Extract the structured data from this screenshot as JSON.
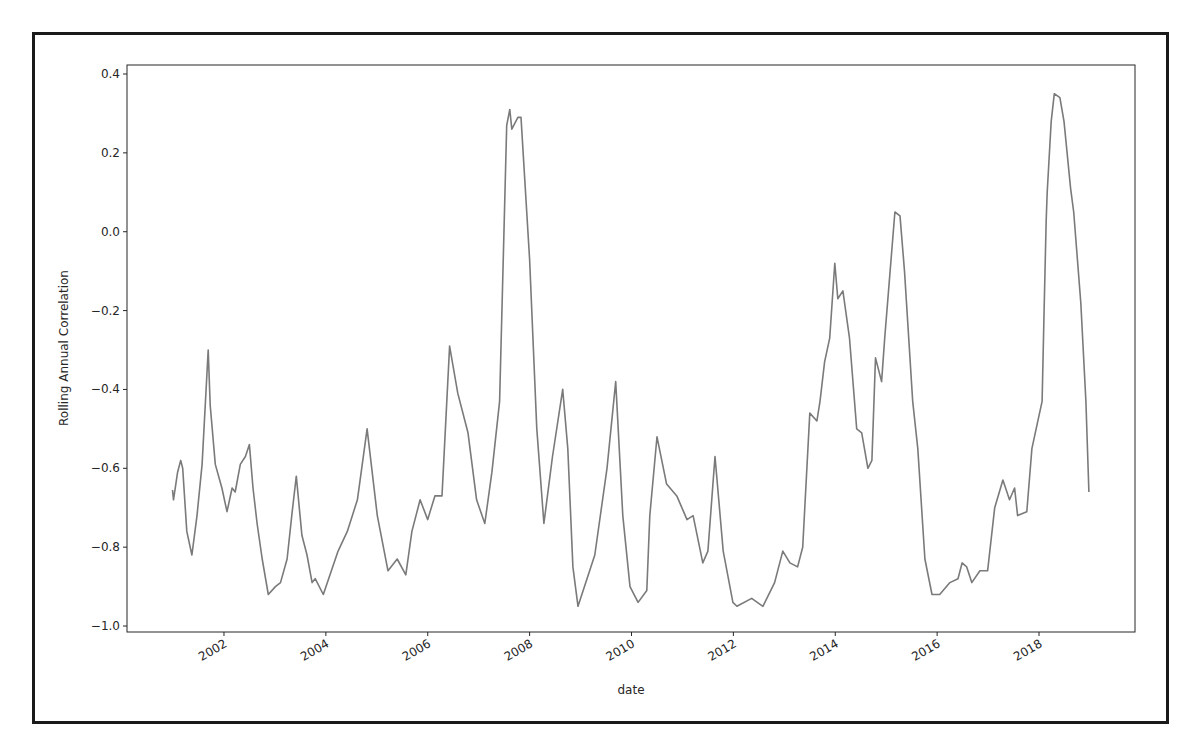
{
  "figure": {
    "border_color": "#1a1a1a",
    "line_color": "#7a7a7a",
    "axes_color": "#262626"
  },
  "chart_data": {
    "type": "line",
    "title": "",
    "xlabel": "date",
    "ylabel": "Rolling Annual Correlation",
    "xlim": [
      2000.1,
      2019.85
    ],
    "ylim": [
      -1.02,
      0.43
    ],
    "grid": false,
    "legend": null,
    "x_ticks": [
      2002,
      2004,
      2006,
      2008,
      2010,
      2012,
      2014,
      2016,
      2018
    ],
    "x_tick_labels": [
      "2002",
      "2004",
      "2006",
      "2008",
      "2010",
      "2012",
      "2014",
      "2016",
      "2018"
    ],
    "x_tick_rotation": -30,
    "y_ticks": [
      0.4,
      0.2,
      0.0,
      -0.2,
      -0.4,
      -0.6,
      -0.8,
      -1.0
    ],
    "y_tick_labels": [
      "0.4",
      "0.2",
      "0.0",
      "−0.2",
      "−0.4",
      "−0.6",
      "−0.8",
      "−1.0"
    ],
    "series": [
      {
        "name": "Rolling Annual Correlation",
        "x": [
          2000.99,
          2001.01,
          2001.09,
          2001.15,
          2001.19,
          2001.27,
          2001.37,
          2001.47,
          2001.57,
          2001.69,
          2001.73,
          2001.83,
          2001.96,
          2002.06,
          2002.16,
          2002.22,
          2002.32,
          2002.42,
          2002.5,
          2002.57,
          2002.65,
          2002.75,
          2002.87,
          2003.01,
          2003.11,
          2003.24,
          2003.34,
          2003.42,
          2003.53,
          2003.63,
          2003.73,
          2003.79,
          2003.95,
          2004.24,
          2004.42,
          2004.62,
          2004.81,
          2005.01,
          2005.22,
          2005.4,
          2005.57,
          2005.69,
          2005.85,
          2006.0,
          2006.14,
          2006.28,
          2006.43,
          2006.59,
          2006.79,
          2006.96,
          2007.12,
          2007.26,
          2007.41,
          2007.55,
          2007.61,
          2007.65,
          2007.77,
          2007.83,
          2008.0,
          2008.14,
          2008.28,
          2008.45,
          2008.65,
          2008.75,
          2008.85,
          2008.95,
          2009.28,
          2009.52,
          2009.69,
          2009.83,
          2009.97,
          2010.13,
          2010.3,
          2010.36,
          2010.5,
          2010.69,
          2010.89,
          2011.09,
          2011.21,
          2011.4,
          2011.5,
          2011.64,
          2011.8,
          2011.99,
          2012.07,
          2012.36,
          2012.58,
          2012.81,
          2012.97,
          2013.11,
          2013.26,
          2013.36,
          2013.5,
          2013.64,
          2013.7,
          2013.79,
          2013.89,
          2013.99,
          2014.05,
          2014.15,
          2014.28,
          2014.42,
          2014.52,
          2014.64,
          2014.72,
          2014.79,
          2014.91,
          2014.97,
          2015.07,
          2015.17,
          2015.27,
          2015.36,
          2015.52,
          2015.62,
          2015.76,
          2015.9,
          2016.05,
          2016.25,
          2016.41,
          2016.49,
          2016.58,
          2016.68,
          2016.84,
          2016.99,
          2017.13,
          2017.29,
          2017.42,
          2017.52,
          2017.58,
          2017.76,
          2017.86,
          2017.96,
          2018.06,
          2018.1,
          2018.14,
          2018.16,
          2018.24,
          2018.3,
          2018.41,
          2018.49,
          2018.62,
          2018.68,
          2018.82,
          2018.92,
          2018.98
        ],
        "values": [
          -0.655,
          -0.68,
          -0.61,
          -0.58,
          -0.6,
          -0.76,
          -0.82,
          -0.72,
          -0.59,
          -0.3,
          -0.44,
          -0.59,
          -0.65,
          -0.71,
          -0.65,
          -0.66,
          -0.59,
          -0.57,
          -0.54,
          -0.65,
          -0.74,
          -0.83,
          -0.92,
          -0.9,
          -0.89,
          -0.83,
          -0.71,
          -0.62,
          -0.77,
          -0.82,
          -0.89,
          -0.88,
          -0.92,
          -0.81,
          -0.76,
          -0.68,
          -0.5,
          -0.72,
          -0.86,
          -0.83,
          -0.87,
          -0.76,
          -0.68,
          -0.73,
          -0.67,
          -0.67,
          -0.29,
          -0.41,
          -0.51,
          -0.68,
          -0.74,
          -0.61,
          -0.43,
          0.27,
          0.31,
          0.26,
          0.29,
          0.29,
          -0.07,
          -0.5,
          -0.74,
          -0.57,
          -0.4,
          -0.55,
          -0.85,
          -0.95,
          -0.82,
          -0.6,
          -0.38,
          -0.72,
          -0.9,
          -0.94,
          -0.91,
          -0.72,
          -0.52,
          -0.64,
          -0.67,
          -0.73,
          -0.72,
          -0.84,
          -0.81,
          -0.57,
          -0.81,
          -0.94,
          -0.95,
          -0.93,
          -0.95,
          -0.89,
          -0.81,
          -0.84,
          -0.85,
          -0.8,
          -0.46,
          -0.48,
          -0.43,
          -0.33,
          -0.27,
          -0.08,
          -0.17,
          -0.15,
          -0.27,
          -0.5,
          -0.51,
          -0.6,
          -0.58,
          -0.32,
          -0.38,
          -0.27,
          -0.11,
          0.05,
          0.04,
          -0.1,
          -0.43,
          -0.55,
          -0.83,
          -0.92,
          -0.92,
          -0.89,
          -0.88,
          -0.84,
          -0.85,
          -0.89,
          -0.86,
          -0.86,
          -0.7,
          -0.63,
          -0.68,
          -0.65,
          -0.72,
          -0.71,
          -0.55,
          -0.49,
          -0.43,
          -0.2,
          0.03,
          0.1,
          0.28,
          0.35,
          0.34,
          0.28,
          0.11,
          0.05,
          -0.18,
          -0.43,
          -0.66
        ]
      }
    ]
  }
}
